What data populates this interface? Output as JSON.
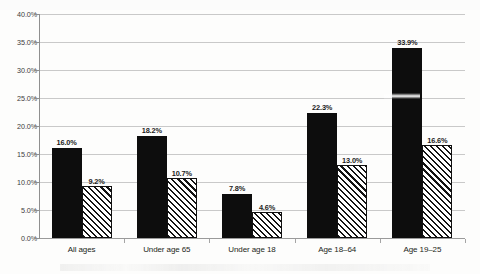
{
  "chart_data": {
    "type": "bar",
    "title": "",
    "subtitle": "",
    "xlabel": "",
    "ylabel": "",
    "ylim": [
      0,
      40
    ],
    "y_tick_labels": [
      "0.0%",
      "5.0%",
      "10.0%",
      "15.0%",
      "20.0%",
      "25.0%",
      "30.0%",
      "35.0%",
      "40.0%"
    ],
    "y_tick_values": [
      0,
      5,
      10,
      15,
      20,
      25,
      30,
      35,
      40
    ],
    "grid": true,
    "legend_position": "none",
    "categories": [
      "All ages",
      "Under age 65",
      "Under age 18",
      "Age 18–64",
      "Age 19–25"
    ],
    "series": [
      {
        "name": "series-1",
        "style": "solid-black",
        "values": [
          16.0,
          18.2,
          7.8,
          22.3,
          33.9
        ],
        "labels": [
          "16.0%",
          "18.2%",
          "7.8%",
          "22.3%",
          "33.9%"
        ]
      },
      {
        "name": "series-2",
        "style": "diagonal-hatch",
        "values": [
          9.2,
          10.7,
          4.6,
          13.0,
          16.6
        ],
        "labels": [
          "9.2%",
          "10.7%",
          "4.6%",
          "13.0%",
          "16.6%"
        ]
      }
    ],
    "colors": {
      "series_1": "#0d0d0d",
      "series_2_fill": "#ffffff",
      "series_2_hatch": "#141414",
      "gridline": "#c9c9c9",
      "axis": "#8f8f8f",
      "text": "#231f20",
      "background": "#fdfdfc"
    }
  }
}
